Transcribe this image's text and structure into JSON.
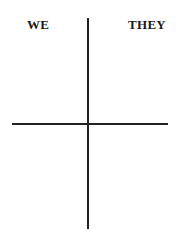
{
  "diagram": {
    "type": "t-chart",
    "labels": {
      "left": "WE",
      "right": "THEY"
    },
    "colors": {
      "ink": "#222222",
      "background": "#ffffff"
    }
  }
}
